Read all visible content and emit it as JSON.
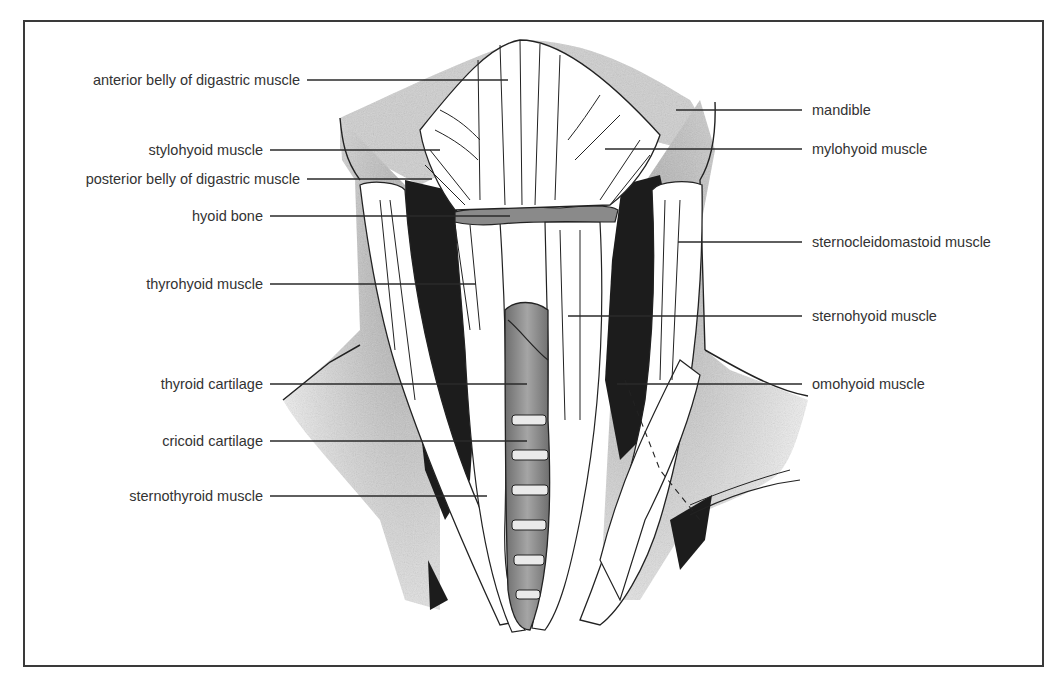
{
  "figure": {
    "colors": {
      "frame": "#3a3a3a",
      "text": "#333333",
      "leader_line": "#2a2a2a",
      "shadow": "#1c1c1c",
      "shading": "#bdbdbd",
      "cartilage": "#8c8c8c",
      "muscle_fill": "#ffffff"
    }
  },
  "labels_left": [
    {
      "id": "anterior-belly-digastric",
      "text": "anterior belly of digastric muscle",
      "y": 80,
      "text_right": 300,
      "line_x1": 307,
      "line_x2": 508
    },
    {
      "id": "stylohyoid",
      "text": "stylohyoid muscle",
      "y": 150,
      "text_right": 263,
      "line_x1": 270,
      "line_x2": 440
    },
    {
      "id": "posterior-belly-digastric",
      "text": "posterior belly of digastric muscle",
      "y": 179,
      "text_right": 300,
      "line_x1": 307,
      "line_x2": 432
    },
    {
      "id": "hyoid-bone",
      "text": "hyoid bone",
      "y": 216,
      "text_right": 263,
      "line_x1": 270,
      "line_x2": 510
    },
    {
      "id": "thyrohyoid",
      "text": "thyrohyoid muscle",
      "y": 284,
      "text_right": 263,
      "line_x1": 270,
      "line_x2": 476
    },
    {
      "id": "thyroid-cartilage",
      "text": "thyroid cartilage",
      "y": 384,
      "text_right": 263,
      "line_x1": 270,
      "line_x2": 527
    },
    {
      "id": "cricoid-cartilage",
      "text": "cricoid cartilage",
      "y": 441,
      "text_right": 263,
      "line_x1": 270,
      "line_x2": 527
    },
    {
      "id": "sternothyroid",
      "text": "sternothyroid muscle",
      "y": 496,
      "text_right": 263,
      "line_x1": 270,
      "line_x2": 487
    }
  ],
  "labels_right": [
    {
      "id": "mandible",
      "text": "mandible",
      "y": 110,
      "text_left": 812,
      "line_x1": 676,
      "line_x2": 802
    },
    {
      "id": "mylohyoid",
      "text": "mylohyoid muscle",
      "y": 149,
      "text_left": 812,
      "line_x1": 605,
      "line_x2": 802
    },
    {
      "id": "sternocleidomastoid",
      "text": "sternocleidomastoid muscle",
      "y": 242,
      "text_left": 812,
      "line_x1": 678,
      "line_x2": 802
    },
    {
      "id": "sternohyoid",
      "text": "sternohyoid muscle",
      "y": 316,
      "text_left": 812,
      "line_x1": 568,
      "line_x2": 802
    },
    {
      "id": "omohyoid",
      "text": "omohyoid muscle",
      "y": 384,
      "text_left": 812,
      "line_x1": 617,
      "line_x2": 802
    }
  ]
}
